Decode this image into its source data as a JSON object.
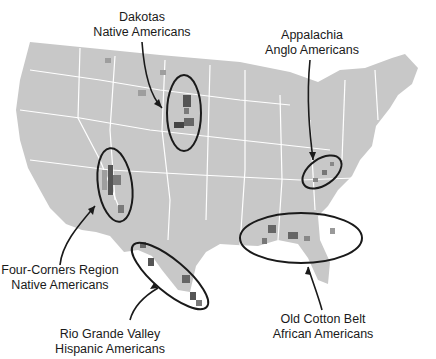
{
  "map": {
    "title_fragment": "",
    "colors": {
      "land": "#c8c8c8",
      "border": "#ffffff",
      "dark": "#555555",
      "mid": "#7a7a7a",
      "light": "#9e9e9e",
      "ink": "#1a1a1a"
    },
    "annotations": [
      {
        "id": "dakotas",
        "line1": "Dakotas",
        "line2": "Native Americans"
      },
      {
        "id": "appalachia",
        "line1": "Appalachia",
        "line2": "Anglo Americans"
      },
      {
        "id": "four-corners",
        "line1": "Four-Corners Region",
        "line2": "Native Americans"
      },
      {
        "id": "rio-grande",
        "line1": "Rio Grande Valley",
        "line2": "Hispanic Americans"
      },
      {
        "id": "cotton-belt",
        "line1": "Old Cotton Belt",
        "line2": "African Americans"
      }
    ]
  }
}
